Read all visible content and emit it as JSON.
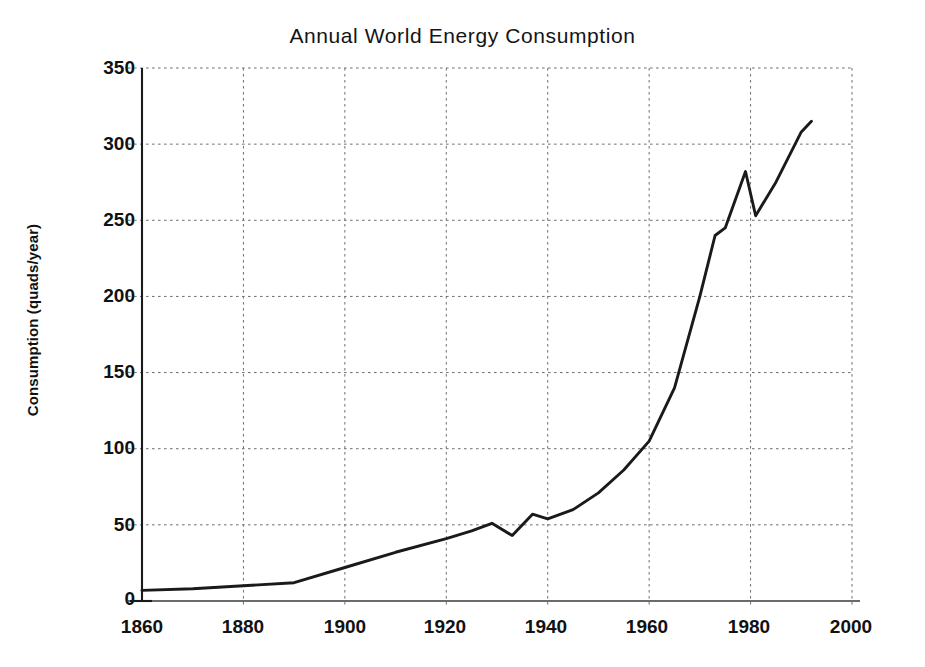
{
  "chart_data": {
    "type": "line",
    "title": "Annual World Energy Consumption",
    "xlabel": "",
    "ylabel": "Consumption (quads/year)",
    "xlim": [
      1860,
      2000
    ],
    "ylim": [
      0,
      350
    ],
    "xticks": [
      1860,
      1880,
      1900,
      1920,
      1940,
      1960,
      1980,
      2000
    ],
    "xtick_labels": [
      "1860",
      "1880",
      "1900",
      "1920",
      "1940",
      "1960",
      "1980",
      "2000"
    ],
    "yticks": [
      0,
      50,
      100,
      150,
      200,
      250,
      300,
      350
    ],
    "ytick_labels": [
      "0",
      "50",
      "100",
      "150",
      "200",
      "250",
      "300",
      "350"
    ],
    "grid": true,
    "grid_style": "dotted",
    "legend": "none",
    "series": [
      {
        "name": "World energy consumption",
        "color": "#1a1a1a",
        "x": [
          1860,
          1870,
          1880,
          1890,
          1900,
          1910,
          1920,
          1925,
          1929,
          1933,
          1937,
          1940,
          1945,
          1950,
          1955,
          1960,
          1965,
          1970,
          1973,
          1975,
          1979,
          1981,
          1985,
          1990,
          1992
        ],
        "y": [
          7,
          8,
          10,
          12,
          22,
          32,
          41,
          46,
          51,
          43,
          57,
          54,
          60,
          71,
          86,
          105,
          140,
          200,
          240,
          245,
          282,
          253,
          275,
          308,
          315
        ]
      }
    ]
  },
  "axis": {
    "x_axis_name": "year-axis",
    "y_axis_name": "consumption-axis"
  }
}
